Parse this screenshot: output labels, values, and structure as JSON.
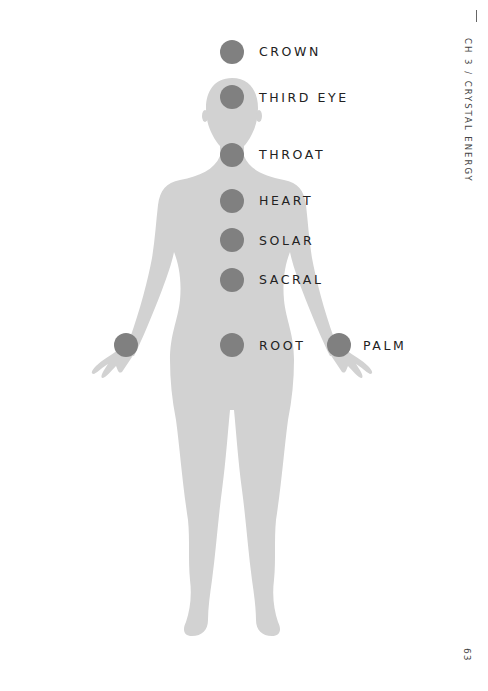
{
  "header": {
    "chapter": "CH 3 / CRYSTAL ENERGY",
    "page_number": "63"
  },
  "colors": {
    "body_fill": "#d2d2d2",
    "point_fill": "#808080",
    "label_text": "#222222"
  },
  "points": [
    {
      "id": "crown",
      "label": "CROWN",
      "cx": 232,
      "cy": 52
    },
    {
      "id": "third-eye",
      "label": "THIRD EYE",
      "cx": 232,
      "cy": 97
    },
    {
      "id": "throat",
      "label": "THROAT",
      "cx": 232,
      "cy": 155
    },
    {
      "id": "heart",
      "label": "HEART",
      "cx": 232,
      "cy": 201
    },
    {
      "id": "solar",
      "label": "SOLAR",
      "cx": 232,
      "cy": 240
    },
    {
      "id": "sacral",
      "label": "SACRAL",
      "cx": 232,
      "cy": 280
    },
    {
      "id": "root",
      "label": "ROOT",
      "cx": 232,
      "cy": 345
    },
    {
      "id": "left-palm",
      "label": "",
      "cx": 126,
      "cy": 345
    },
    {
      "id": "palm",
      "label": "PALM",
      "cx": 339,
      "cy": 345
    }
  ]
}
